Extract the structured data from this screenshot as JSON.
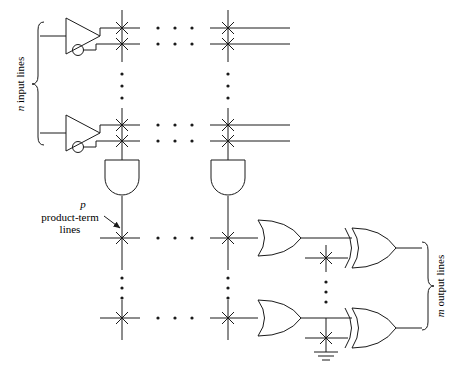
{
  "figure": {
    "name": "pla-block-diagram",
    "background_color": "#ffffff",
    "line_color": "#1a1a1a"
  },
  "labels": {
    "input_lines": {
      "italic_part": "n",
      "text_part": " input lines",
      "full": "n input lines",
      "orientation": "vertical-rotated",
      "side": "left"
    },
    "product_term_lines": {
      "line1_italic": "p",
      "line2": "product-term",
      "line3": "lines",
      "full": "p product-term lines",
      "orientation": "horizontal",
      "side": "left"
    },
    "output_lines": {
      "italic_part": "m",
      "text_part": " output lines",
      "full": "m output lines",
      "orientation": "vertical-rotated",
      "side": "right"
    }
  },
  "ellipsis": {
    "dot_char": "•",
    "horizontal_groups": 7,
    "vertical_groups": 4,
    "dots_per_group": 3
  },
  "components": {
    "input_buffers": {
      "count": 2,
      "type": "buffer-inverter-pair",
      "description": "triangle buffer with true output and complemented (bubble) output"
    },
    "and_gates": {
      "count": 2,
      "type": "and-gate",
      "orientation": "downward",
      "description": "AND array product term gates"
    },
    "or_gates": {
      "count": 2,
      "type": "or-gate",
      "orientation": "rightward",
      "description": "OR array sum gates"
    },
    "xor_gates": {
      "count": 2,
      "type": "xor-gate",
      "orientation": "rightward",
      "description": "output polarity XOR gates"
    },
    "ground_symbol": {
      "count": 1,
      "type": "ground",
      "bars": 3
    },
    "crosspoints": {
      "count": 14,
      "type": "x-mark",
      "description": "programmable connection crosspoints"
    }
  },
  "geometry": {
    "canvas": {
      "width": 451,
      "height": 373
    },
    "vertical_lines_x": [
      122,
      228
    ],
    "input_rows_y": [
      28,
      44,
      125,
      141
    ],
    "product_rows_y": [
      238,
      318
    ],
    "vertical_line_top": 10,
    "vertical_line_bottom": 340
  }
}
